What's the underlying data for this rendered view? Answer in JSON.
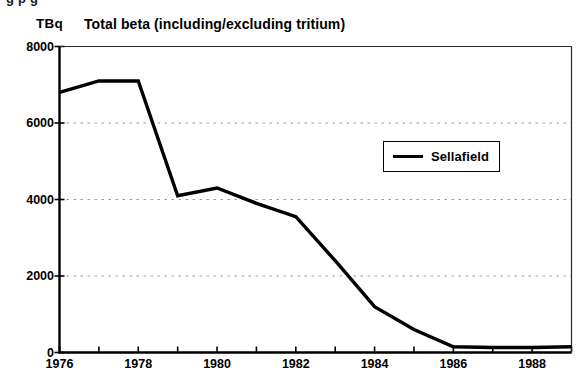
{
  "figure": {
    "clipped_top_text": "g                                       p                     g",
    "unit_label": "TBq"
  },
  "chart_data": {
    "type": "line",
    "title": "Total beta (including/excluding tritium)",
    "xlabel": "",
    "ylabel": "TBq",
    "ylim": [
      0,
      8000
    ],
    "xlim": [
      1976,
      1989
    ],
    "grid": true,
    "grid_axis": "y",
    "grid_style": "dotted",
    "legend_position": "upper-right-inside",
    "ytick_labels": [
      "0",
      "2000",
      "4000",
      "6000",
      "8000"
    ],
    "ytick_values": [
      0,
      2000,
      4000,
      6000,
      8000
    ],
    "xtick_values": [
      1976,
      1977,
      1978,
      1979,
      1980,
      1981,
      1982,
      1983,
      1984,
      1985,
      1986,
      1987,
      1988,
      1989
    ],
    "xtick_labels": [
      "1976",
      "",
      "1978",
      "",
      "1980",
      "",
      "1982",
      "",
      "1984",
      "",
      "1986",
      "",
      "1988",
      ""
    ],
    "x": [
      1976,
      1977,
      1978,
      1979,
      1980,
      1981,
      1982,
      1983,
      1984,
      1985,
      1986,
      1987,
      1988,
      1989
    ],
    "series": [
      {
        "name": "Sellafield",
        "color": "#000000",
        "values": [
          6800,
          7100,
          7100,
          4100,
          4300,
          3900,
          3550,
          2400,
          1200,
          600,
          150,
          130,
          130,
          150
        ]
      }
    ]
  }
}
